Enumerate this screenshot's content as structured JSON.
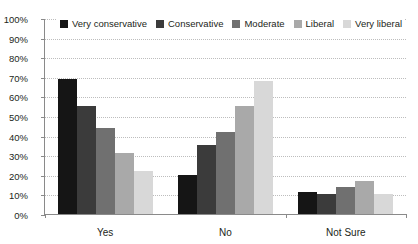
{
  "chart_data": {
    "type": "bar",
    "title": "",
    "subtitle": "",
    "xlabel": "",
    "ylabel": "",
    "categories": [
      "Yes",
      "No",
      "Not Sure"
    ],
    "series": [
      {
        "name": "Very conservative",
        "color": "#151515",
        "values": [
          69,
          20,
          11
        ]
      },
      {
        "name": "Conservative",
        "color": "#3b3b3b",
        "values": [
          55,
          35,
          10
        ]
      },
      {
        "name": "Moderate",
        "color": "#707070",
        "values": [
          44,
          42,
          14
        ]
      },
      {
        "name": "Liberal",
        "color": "#a9a9a9",
        "values": [
          31,
          55,
          17
        ]
      },
      {
        "name": "Very liberal",
        "color": "#d8d8d8",
        "values": [
          22,
          68,
          10
        ]
      }
    ],
    "ylim": [
      0,
      100
    ],
    "ytick_values": [
      0,
      10,
      20,
      30,
      40,
      50,
      60,
      70,
      80,
      90,
      100
    ],
    "ytick_labels": [
      "0%",
      "10%",
      "20%",
      "30%",
      "40%",
      "50%",
      "60%",
      "70%",
      "80%",
      "90%",
      "100%"
    ],
    "grid": true,
    "grid_axis": "y",
    "legend_position": "top-left-inside",
    "value_suffix": "%"
  },
  "axis": {
    "line_color": "#8a8a8a",
    "grid_color": "#bdbdbd",
    "text_color": "#231f20"
  }
}
